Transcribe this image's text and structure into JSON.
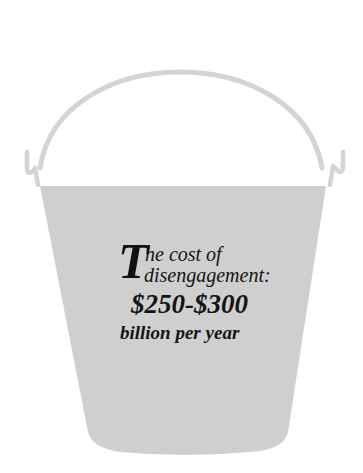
{
  "illustration": {
    "subject": "bucket",
    "colors": {
      "bucket_fill": "#cfcfcf",
      "handle_stroke": "#d4d4d4",
      "text": "#141414",
      "background": "#ffffff"
    }
  },
  "caption": {
    "dropcap": "T",
    "line1": "he cost of",
    "line2": "disengagement:",
    "amount": "$250-$300",
    "line4": "billion per year"
  }
}
